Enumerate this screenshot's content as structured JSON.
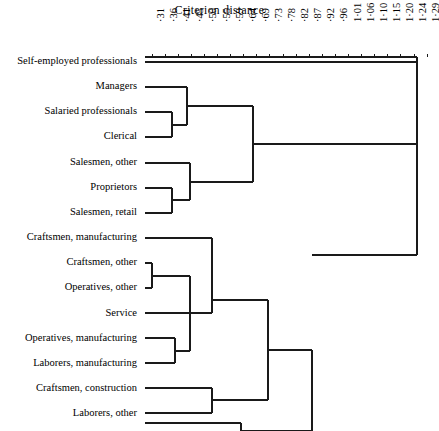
{
  "chart_data": {
    "type": "dendrogram",
    "title": "Criterion  distance",
    "xlabel": "Criterion distance",
    "ylabel": "",
    "grid": false,
    "legend": "none",
    "axis_position": "top",
    "xlim": [
      0.31,
      1.29
    ],
    "tick_labels": [
      "·31",
      "·36",
      "·41",
      "·45",
      "·50",
      "·55",
      "·59",
      "·64",
      "·69",
      "·73",
      "·78",
      "·82",
      "·87",
      "·92",
      "·96",
      "1·01",
      "1·06",
      "1·10",
      "1·15",
      "1·20",
      "1·24",
      "1·29"
    ],
    "tick_values": [
      0.31,
      0.36,
      0.41,
      0.45,
      0.5,
      0.55,
      0.59,
      0.64,
      0.69,
      0.73,
      0.78,
      0.82,
      0.87,
      0.92,
      0.96,
      1.01,
      1.06,
      1.1,
      1.15,
      1.2,
      1.24,
      1.29
    ],
    "leaves": [
      {
        "index": 0,
        "label": "Self-employed professionals"
      },
      {
        "index": 1,
        "label": "Managers"
      },
      {
        "index": 2,
        "label": "Salaried professionals"
      },
      {
        "index": 3,
        "label": "Clerical"
      },
      {
        "index": 4,
        "label": "Salesmen,  other"
      },
      {
        "index": 5,
        "label": "Proprietors"
      },
      {
        "index": 6,
        "label": "Salesmen,  retail"
      },
      {
        "index": 7,
        "label": "Craftsmen, manufacturing"
      },
      {
        "index": 8,
        "label": "Craftsmen, other"
      },
      {
        "index": 9,
        "label": "Operatives, other"
      },
      {
        "index": 10,
        "label": "Service"
      },
      {
        "index": 11,
        "label": "Operatives, manufacturing"
      },
      {
        "index": 12,
        "label": "Laborers, manufacturing"
      },
      {
        "index": 13,
        "label": "Craftsmen, construction"
      },
      {
        "index": 14,
        "label": "Laborers, other"
      },
      {
        "index": 15,
        "label": "Farmers"
      }
    ],
    "merges": [
      {
        "id": "m1",
        "children": [
          "Salaried professionals",
          "Clerical"
        ],
        "distance": 0.49
      },
      {
        "id": "m2",
        "children": [
          "Managers",
          "m1"
        ],
        "distance": 0.54
      },
      {
        "id": "m3",
        "children": [
          "Proprietors",
          "Salesmen,  retail"
        ],
        "distance": 0.49
      },
      {
        "id": "m4",
        "children": [
          "Salesmen,  other",
          "m3"
        ],
        "distance": 0.57
      },
      {
        "id": "m5",
        "children": [
          "m2",
          "m4"
        ],
        "distance": 0.85
      },
      {
        "id": "m6",
        "children": [
          "Craftsmen, other",
          "Operatives, other"
        ],
        "distance": 0.35
      },
      {
        "id": "m7",
        "children": [
          "Operatives, manufacturing",
          "Laborers, manufacturing"
        ],
        "distance": 0.42
      },
      {
        "id": "m8",
        "children": [
          "m6",
          "m7"
        ],
        "distance": 0.46
      },
      {
        "id": "m9",
        "children": [
          "Craftsmen, manufacturing",
          "Service"
        ],
        "distance": 0.53
      },
      {
        "id": "m10",
        "children": [
          "m8",
          "m9"
        ],
        "distance": 0.63
      },
      {
        "id": "m11",
        "children": [
          "Craftsmen, construction",
          "Laborers, other"
        ],
        "distance": 0.53
      },
      {
        "id": "m12",
        "children": [
          "m10",
          "m11"
        ],
        "distance": 0.93
      },
      {
        "id": "m13",
        "children": [
          "m12",
          "Farmers"
        ],
        "distance": 1.07
      },
      {
        "id": "m14",
        "children": [
          "m5",
          "m13"
        ],
        "distance": 1.07
      },
      {
        "id": "m15",
        "children": [
          "Self-employed professionals",
          "m14"
        ],
        "distance": 1.29
      }
    ]
  },
  "geometry": {
    "plot_left": 145,
    "plot_right": 417,
    "axis_y": 57,
    "row_top": 62,
    "row_step": 25.15,
    "tick_x0": 152,
    "tick_dx": 13.1,
    "line_color": "#1a1a1a",
    "line_width": 1.3,
    "segments": [
      {
        "name": "axis-baseline",
        "x1": 145,
        "y1": 57,
        "x2": 417,
        "y2": 57
      },
      {
        "name": "axis-right-cap",
        "x1": 417,
        "y1": 57,
        "x2": 417,
        "y2": 62
      },
      {
        "name": "leaf-self-employed",
        "x1": 145,
        "y1": 62,
        "x2": 417,
        "y2": 62
      },
      {
        "name": "root-stem",
        "x1": 417,
        "y1": 62,
        "x2": 417,
        "y2": 255
      },
      {
        "name": "root-bar",
        "x1": 312,
        "y1": 255,
        "x2": 417,
        "y2": 255
      },
      {
        "name": "leaf-managers",
        "x1": 145,
        "y1": 87,
        "x2": 187,
        "y2": 87
      },
      {
        "name": "leaf-salaried",
        "x1": 145,
        "y1": 112,
        "x2": 172,
        "y2": 112
      },
      {
        "name": "leaf-clerical",
        "x1": 145,
        "y1": 137,
        "x2": 172,
        "y2": 137
      },
      {
        "name": "merge-m1-v",
        "x1": 172,
        "y1": 112,
        "x2": 172,
        "y2": 137
      },
      {
        "name": "merge-m1-h",
        "x1": 172,
        "y1": 125,
        "x2": 187,
        "y2": 125
      },
      {
        "name": "merge-m2-v",
        "x1": 187,
        "y1": 87,
        "x2": 187,
        "y2": 125
      },
      {
        "name": "merge-m2-h",
        "x1": 187,
        "y1": 106,
        "x2": 253,
        "y2": 106
      },
      {
        "name": "leaf-salesmen-other",
        "x1": 145,
        "y1": 163,
        "x2": 190,
        "y2": 163
      },
      {
        "name": "leaf-proprietors",
        "x1": 145,
        "y1": 188,
        "x2": 172,
        "y2": 188
      },
      {
        "name": "leaf-salesmen-retail",
        "x1": 145,
        "y1": 213,
        "x2": 172,
        "y2": 213
      },
      {
        "name": "merge-m3-v",
        "x1": 172,
        "y1": 188,
        "x2": 172,
        "y2": 213
      },
      {
        "name": "merge-m3-h",
        "x1": 172,
        "y1": 200,
        "x2": 190,
        "y2": 200
      },
      {
        "name": "merge-m4-v",
        "x1": 190,
        "y1": 163,
        "x2": 190,
        "y2": 200
      },
      {
        "name": "merge-m4-h",
        "x1": 190,
        "y1": 182,
        "x2": 253,
        "y2": 182
      },
      {
        "name": "merge-m5-v",
        "x1": 253,
        "y1": 106,
        "x2": 253,
        "y2": 182
      },
      {
        "name": "merge-m5-h",
        "x1": 253,
        "y1": 144,
        "x2": 417,
        "y2": 144
      },
      {
        "name": "leaf-craftsmen-mfg",
        "x1": 145,
        "y1": 238,
        "x2": 212,
        "y2": 238
      },
      {
        "name": "leaf-craftsmen-other",
        "x1": 145,
        "y1": 263,
        "x2": 152,
        "y2": 263
      },
      {
        "name": "leaf-operatives-other",
        "x1": 145,
        "y1": 288,
        "x2": 152,
        "y2": 288
      },
      {
        "name": "merge-m6-v",
        "x1": 152,
        "y1": 263,
        "x2": 152,
        "y2": 288
      },
      {
        "name": "merge-m6-h",
        "x1": 152,
        "y1": 276,
        "x2": 190,
        "y2": 276
      },
      {
        "name": "leaf-service",
        "x1": 145,
        "y1": 313,
        "x2": 212,
        "y2": 313
      },
      {
        "name": "leaf-operatives-mfg",
        "x1": 145,
        "y1": 338,
        "x2": 175,
        "y2": 338
      },
      {
        "name": "leaf-laborers-mfg",
        "x1": 145,
        "y1": 363,
        "x2": 175,
        "y2": 363
      },
      {
        "name": "merge-m7-v",
        "x1": 175,
        "y1": 338,
        "x2": 175,
        "y2": 363
      },
      {
        "name": "merge-m7-h",
        "x1": 175,
        "y1": 351,
        "x2": 190,
        "y2": 351
      },
      {
        "name": "merge-m8-v",
        "x1": 190,
        "y1": 276,
        "x2": 190,
        "y2": 351
      },
      {
        "name": "merge-m8-h",
        "x1": 190,
        "y1": 313,
        "x2": 212,
        "y2": 313
      },
      {
        "name": "merge-m9-v",
        "x1": 212,
        "y1": 238,
        "x2": 212,
        "y2": 313
      },
      {
        "name": "merge-m9-h",
        "x1": 212,
        "y1": 300,
        "x2": 268,
        "y2": 300
      },
      {
        "name": "leaf-craftsmen-constr",
        "x1": 145,
        "y1": 388,
        "x2": 212,
        "y2": 388
      },
      {
        "name": "leaf-laborers-other",
        "x1": 145,
        "y1": 413,
        "x2": 212,
        "y2": 413
      },
      {
        "name": "merge-m11-v",
        "x1": 212,
        "y1": 388,
        "x2": 212,
        "y2": 413
      },
      {
        "name": "merge-m11-h",
        "x1": 212,
        "y1": 400,
        "x2": 268,
        "y2": 400
      },
      {
        "name": "merge-m12-v",
        "x1": 268,
        "y1": 300,
        "x2": 268,
        "y2": 400
      },
      {
        "name": "merge-m12-h",
        "x1": 268,
        "y1": 350,
        "x2": 312,
        "y2": 350
      },
      {
        "name": "leaf-farmers",
        "x1": 145,
        "y1": 423,
        "x2": 241,
        "y2": 423
      },
      {
        "name": "merge-m13-farmers-v",
        "x1": 241,
        "y1": 423,
        "x2": 241,
        "y2": 431
      },
      {
        "name": "merge-m13-v",
        "x1": 312,
        "y1": 350,
        "x2": 312,
        "y2": 431
      },
      {
        "name": "merge-m13-h",
        "x1": 241,
        "y1": 431,
        "x2": 312,
        "y2": 431
      }
    ]
  }
}
